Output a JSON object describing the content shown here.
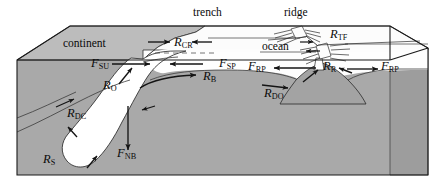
{
  "figure": {
    "type": "geologic-block-diagram",
    "colors": {
      "background": "#ffffff",
      "continent_top": "#bcbcbc",
      "continent_side": "#ababab",
      "mantle_side": "#a9a9a9",
      "ocean_water": "#fdfdfd",
      "lithosphere_slab": "#fefefe",
      "ocean_top": "#fbfbfb",
      "outline": "#1a1a1a",
      "label_text": "#0a0a0a"
    }
  },
  "word_labels": [
    {
      "id": "trench",
      "text": "trench",
      "x": 193,
      "y": 13
    },
    {
      "id": "ridge",
      "text": "ridge",
      "x": 284,
      "y": 13
    },
    {
      "id": "continent",
      "text": "continent",
      "x": 63,
      "y": 44
    },
    {
      "id": "ocean",
      "text": "ocean",
      "x": 262,
      "y": 46
    }
  ],
  "force_labels": [
    {
      "id": "R_CR",
      "base": "R",
      "sub": "CR",
      "x": 174,
      "y": 42,
      "meaning": "colliding resistance"
    },
    {
      "id": "R_TF",
      "base": "R",
      "sub": "TF",
      "x": 330,
      "y": 34,
      "meaning": "transform fault resistance"
    },
    {
      "id": "F_SU",
      "base": "F",
      "sub": "SU",
      "x": 91,
      "y": 63,
      "meaning": "suction force"
    },
    {
      "id": "R_O",
      "base": "R",
      "sub": "O",
      "x": 112,
      "y": 80,
      "meaning": "overriding plate resistance"
    },
    {
      "id": "R_B",
      "base": "R",
      "sub": "B",
      "x": 203,
      "y": 73,
      "meaning": "bending resistance"
    },
    {
      "id": "F_SP",
      "base": "F",
      "sub": "SP",
      "x": 221,
      "y": 63,
      "meaning": "slab pull force"
    },
    {
      "id": "F_RP",
      "base": "F",
      "sub": "RP",
      "x": 249,
      "y": 67,
      "meaning": "ridge push force"
    },
    {
      "id": "R_R",
      "base": "R",
      "sub": "R",
      "x": 325,
      "y": 66,
      "meaning": "ridge resistance"
    },
    {
      "id": "F_RP_right",
      "base": "F",
      "sub": "RP",
      "x": 382,
      "y": 67,
      "meaning": "ridge push force"
    },
    {
      "id": "R_DO",
      "base": "R",
      "sub": "DO",
      "x": 266,
      "y": 92,
      "meaning": "drag resistance oceanic"
    },
    {
      "id": "R_DC",
      "base": "R",
      "sub": "DC",
      "x": 68,
      "y": 112,
      "meaning": "drag resistance continental"
    },
    {
      "id": "F_NB",
      "base": "F",
      "sub": "NB",
      "x": 118,
      "y": 152,
      "meaning": "negative buoyancy force"
    },
    {
      "id": "R_S",
      "base": "R",
      "sub": "S",
      "x": 44,
      "y": 158,
      "meaning": "slab resistance"
    }
  ],
  "arrows": [
    {
      "id": "arrow-R_CR-left",
      "from": [
        147,
        42
      ],
      "to": [
        173,
        42
      ],
      "dir": "right"
    },
    {
      "id": "arrow-R_CR-right",
      "from": [
        210,
        42
      ],
      "to": [
        190,
        42
      ],
      "dir": "left"
    },
    {
      "id": "arrow-F_SU",
      "from": [
        110,
        64
      ],
      "to": [
        148,
        64
      ],
      "dir": "right"
    },
    {
      "id": "arrow-R_O",
      "from": [
        110,
        88
      ],
      "to": [
        132,
        70
      ],
      "dir": "up-right"
    },
    {
      "id": "arrow-R_B",
      "from": [
        150,
        76
      ],
      "to": [
        200,
        76
      ],
      "dir": "right"
    },
    {
      "id": "arrow-F_SP",
      "from": [
        200,
        64
      ],
      "to": [
        168,
        64
      ],
      "dir": "left"
    },
    {
      "id": "arrow-F_RP-left",
      "from": [
        315,
        68
      ],
      "to": [
        272,
        68
      ],
      "dir": "left"
    },
    {
      "id": "arrow-R_R-left",
      "from": [
        305,
        82
      ],
      "to": [
        322,
        70
      ],
      "dir": "up-right"
    },
    {
      "id": "arrow-R_R-right",
      "from": [
        352,
        74
      ],
      "to": [
        335,
        68
      ],
      "dir": "up-left"
    },
    {
      "id": "arrow-F_RP-right",
      "from": [
        348,
        70
      ],
      "to": [
        380,
        70
      ],
      "dir": "right"
    },
    {
      "id": "arrow-R_DO",
      "from": [
        262,
        86
      ],
      "to": [
        288,
        88
      ],
      "dir": "right"
    },
    {
      "id": "arrow-R_DC",
      "from": [
        58,
        105
      ],
      "to": [
        76,
        100
      ],
      "dir": "up-right"
    },
    {
      "id": "arrow-F_NB",
      "from": [
        128,
        107
      ],
      "to": [
        128,
        152
      ],
      "dir": "down"
    },
    {
      "id": "arrow-R_S",
      "from": [
        75,
        135
      ],
      "to": [
        66,
        128
      ],
      "dir": "up-left"
    },
    {
      "id": "arrow-R_S-2",
      "from": [
        88,
        166
      ],
      "to": [
        96,
        156
      ],
      "dir": "up-right"
    },
    {
      "id": "arrow-ridge-A",
      "from": [
        300,
        42
      ],
      "to": [
        314,
        42
      ],
      "dir": "right"
    },
    {
      "id": "arrow-ridge-B",
      "from": [
        318,
        50
      ],
      "to": [
        304,
        50
      ],
      "dir": "left"
    }
  ]
}
